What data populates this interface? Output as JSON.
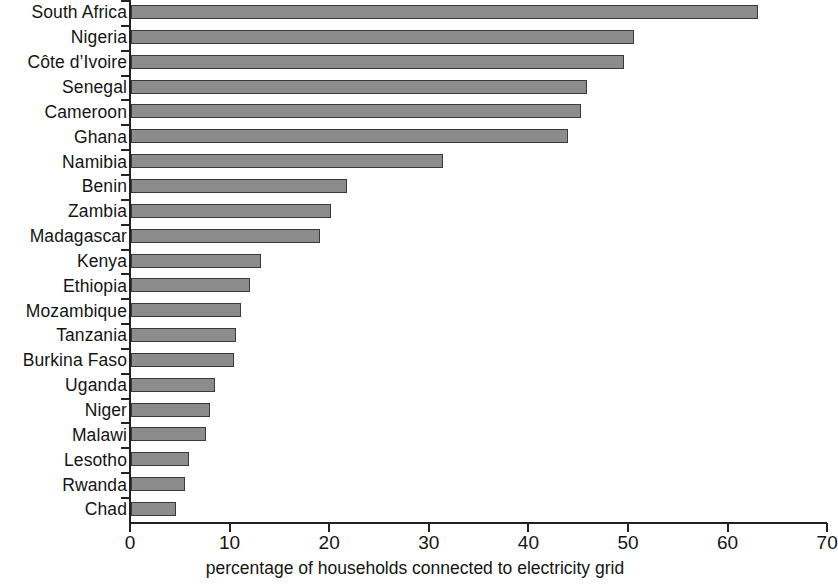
{
  "chart_data": {
    "type": "bar",
    "orientation": "horizontal",
    "title": "",
    "subtitle": "",
    "xlabel": "percentage of households connected to electricity grid",
    "ylabel": "",
    "xlim": [
      0,
      70
    ],
    "xticks": [
      0,
      10,
      20,
      30,
      40,
      50,
      60,
      70
    ],
    "xtick_labels": [
      "0",
      "10",
      "20",
      "30",
      "40",
      "50",
      "60",
      "70"
    ],
    "grid": false,
    "legend": null,
    "bar_color": "#8c8c8c",
    "bar_edge_color": "#3a3a3a",
    "axis_color": "#222222",
    "categories": [
      "South Africa",
      "Nigeria",
      "Côte d’Ivoire",
      "Senegal",
      "Cameroon",
      "Ghana",
      "Namibia",
      "Benin",
      "Zambia",
      "Madagascar",
      "Kenya",
      "Ethiopia",
      "Mozambique",
      "Tanzania",
      "Burkina Faso",
      "Uganda",
      "Niger",
      "Malawi",
      "Lesotho",
      "Rwanda",
      "Chad"
    ],
    "values": [
      63.0,
      50.5,
      49.5,
      45.8,
      45.2,
      43.9,
      31.3,
      21.7,
      20.1,
      19.0,
      13.1,
      11.9,
      11.0,
      10.5,
      10.3,
      8.4,
      7.9,
      7.5,
      5.8,
      5.4,
      4.5
    ]
  }
}
